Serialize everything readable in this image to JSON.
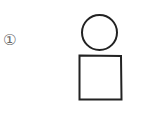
{
  "figure": {
    "label": "①",
    "shapes": [
      {
        "type": "circle",
        "name": "head-circle",
        "cx": 99.5,
        "cy": 32.5,
        "r": 17.5
      },
      {
        "type": "rect",
        "name": "body-square",
        "x": 79.5,
        "y": 55.5,
        "width": 42,
        "height": 44
      }
    ],
    "stroke_color": "#222222",
    "label_color": "#6a6a6a"
  }
}
